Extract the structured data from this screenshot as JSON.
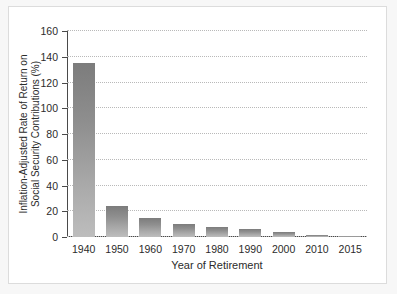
{
  "chart_data": {
    "type": "bar",
    "title": "",
    "xlabel": "Year of Retirement",
    "ylabel": "Inflation-Adjusted Rate of Return on Social Security Contributions (%)",
    "ylabel_line1": "Inflation-Adjusted Rate of Return on",
    "ylabel_line2": "Social Security Contributions (%)",
    "categories": [
      "1940",
      "1950",
      "1960",
      "1970",
      "1980",
      "1990",
      "2000",
      "2010",
      "2015"
    ],
    "values": [
      135,
      24,
      15,
      10,
      8,
      6,
      4,
      1.5,
      1
    ],
    "ylim": [
      0,
      160
    ],
    "ytick_labels": [
      "0",
      "20",
      "40",
      "60",
      "80",
      "100",
      "120",
      "140",
      "160"
    ],
    "ytick_values": [
      0,
      20,
      40,
      60,
      80,
      100,
      120,
      140,
      160
    ],
    "grid": "horizontal-dotted",
    "legend": "none",
    "bar_color_top": "#7c7c7c",
    "bar_color_bottom": "#bdbdbd",
    "axis_color": "#4a4a4a",
    "grid_color": "#b9b9b9",
    "panel_background": "#ffffff",
    "page_background": "#f7f7f7"
  }
}
